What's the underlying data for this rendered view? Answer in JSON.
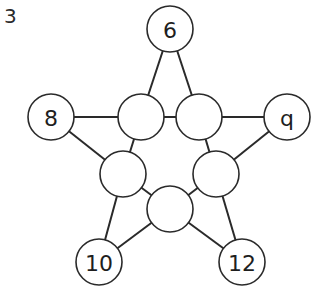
{
  "puzzle": {
    "number": "3"
  },
  "diagram": {
    "node_radius": 23,
    "stroke_color": "#2a2a2a",
    "nodes": [
      {
        "id": "outer-top",
        "label": "6",
        "x": 170,
        "y": 29
      },
      {
        "id": "outer-left",
        "label": "8",
        "x": 51,
        "y": 117
      },
      {
        "id": "outer-right",
        "label": "q",
        "x": 287,
        "y": 117
      },
      {
        "id": "outer-bottom-left",
        "label": "10",
        "x": 99,
        "y": 262
      },
      {
        "id": "outer-bottom-right",
        "label": "12",
        "x": 242,
        "y": 262
      },
      {
        "id": "inner-top-left",
        "label": "",
        "x": 141,
        "y": 117
      },
      {
        "id": "inner-top-right",
        "label": "",
        "x": 199,
        "y": 117
      },
      {
        "id": "inner-left",
        "label": "",
        "x": 123,
        "y": 174
      },
      {
        "id": "inner-right",
        "label": "",
        "x": 216,
        "y": 174
      },
      {
        "id": "inner-bottom",
        "label": "",
        "x": 170,
        "y": 209
      }
    ],
    "edges": [
      [
        "outer-top",
        "inner-top-left"
      ],
      [
        "outer-top",
        "inner-top-right"
      ],
      [
        "outer-left",
        "inner-top-left"
      ],
      [
        "outer-left",
        "inner-left"
      ],
      [
        "outer-right",
        "inner-top-right"
      ],
      [
        "outer-right",
        "inner-right"
      ],
      [
        "outer-bottom-left",
        "inner-left"
      ],
      [
        "outer-bottom-left",
        "inner-bottom"
      ],
      [
        "outer-bottom-right",
        "inner-right"
      ],
      [
        "outer-bottom-right",
        "inner-bottom"
      ],
      [
        "inner-top-left",
        "inner-top-right"
      ],
      [
        "inner-top-left",
        "inner-left"
      ],
      [
        "inner-top-right",
        "inner-right"
      ],
      [
        "inner-left",
        "inner-bottom"
      ],
      [
        "inner-right",
        "inner-bottom"
      ]
    ]
  }
}
